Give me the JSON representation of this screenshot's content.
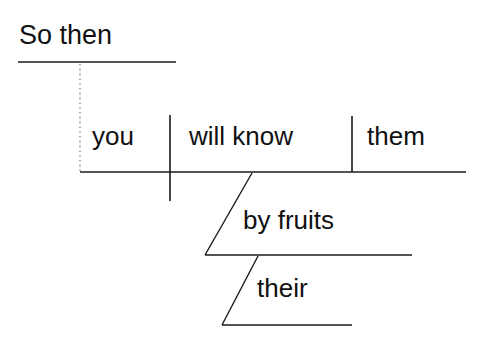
{
  "diagram": {
    "type": "reed-kellogg-sentence-diagram",
    "sentence": "So then you will know them by their fruits",
    "background_color": "#ffffff",
    "line_color": "#1a1a1a",
    "text_color": "#111111",
    "introductory": {
      "label": "So then",
      "kind": "introductory-phrase"
    },
    "main_clause": {
      "subject": "you",
      "verb": "will know",
      "direct_object": "them"
    },
    "modifiers": [
      {
        "label": "by fruits",
        "kind": "prepositional-phrase",
        "attaches_to": "will know"
      },
      {
        "label": "their",
        "kind": "possessive-modifier",
        "attaches_to": "fruits"
      }
    ],
    "lines": {
      "intro_rule": {
        "x1": 18,
        "y1": 62,
        "x2": 176,
        "y2": 62
      },
      "intro_connector": {
        "x1": 80,
        "y1": 64,
        "x2": 80,
        "y2": 171,
        "style": "dotted"
      },
      "baseline": {
        "x1": 80,
        "y1": 172,
        "x2": 466,
        "y2": 172
      },
      "subject_verb_divider": {
        "x1": 170,
        "y1": 115,
        "x2": 170,
        "y2": 201
      },
      "verb_object_divider": {
        "x1": 352,
        "y1": 116,
        "x2": 352,
        "y2": 172
      },
      "prep_slant": {
        "x1": 252,
        "y1": 173,
        "x2": 205,
        "y2": 255
      },
      "prep_baseline": {
        "x1": 205,
        "y1": 255,
        "x2": 412,
        "y2": 255
      },
      "possessive_slant": {
        "x1": 258,
        "y1": 256,
        "x2": 222,
        "y2": 325
      },
      "possessive_baseline": {
        "x1": 222,
        "y1": 325,
        "x2": 352,
        "y2": 325
      }
    }
  }
}
